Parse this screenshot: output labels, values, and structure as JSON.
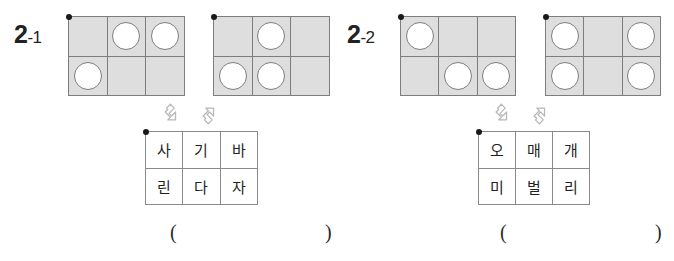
{
  "page": {
    "width": 674,
    "height": 261,
    "background": "#ffffff",
    "grid_fill": "#dedede",
    "grid_line": "#7d7d7d",
    "circle_fill": "#ffffff",
    "dot_color": "#1a1a1a"
  },
  "problems": [
    {
      "id": "2-1",
      "number": "2",
      "suffix": "-1",
      "circle_grids": [
        {
          "name": "grid-a",
          "rows": 2,
          "cols": 3,
          "circles": [
            [
              false,
              true,
              true
            ],
            [
              true,
              false,
              false
            ]
          ]
        },
        {
          "name": "grid-b",
          "rows": 2,
          "cols": 3,
          "circles": [
            [
              false,
              true,
              false
            ],
            [
              true,
              true,
              false
            ]
          ]
        }
      ],
      "arrows": [
        {
          "name": "arrow-down-right",
          "glyph": "down-right"
        },
        {
          "name": "arrow-up-right",
          "glyph": "up-right"
        }
      ],
      "word_grid": {
        "rows": [
          [
            "사",
            "기",
            "바"
          ],
          [
            "린",
            "다",
            "자"
          ]
        ]
      },
      "answer": {
        "open": "(",
        "close": ")",
        "value": ""
      }
    },
    {
      "id": "2-2",
      "number": "2",
      "suffix": "-2",
      "circle_grids": [
        {
          "name": "grid-c",
          "rows": 2,
          "cols": 3,
          "circles": [
            [
              true,
              false,
              false
            ],
            [
              false,
              true,
              true
            ]
          ]
        },
        {
          "name": "grid-d",
          "rows": 2,
          "cols": 3,
          "circles": [
            [
              true,
              false,
              true
            ],
            [
              true,
              false,
              true
            ]
          ]
        }
      ],
      "arrows": [
        {
          "name": "arrow-down-right",
          "glyph": "down-right"
        },
        {
          "name": "arrow-up-right",
          "glyph": "up-right"
        }
      ],
      "word_grid": {
        "rows": [
          [
            "오",
            "매",
            "개"
          ],
          [
            "미",
            "벌",
            "리"
          ]
        ]
      },
      "answer": {
        "open": "(",
        "close": ")",
        "value": ""
      }
    }
  ]
}
